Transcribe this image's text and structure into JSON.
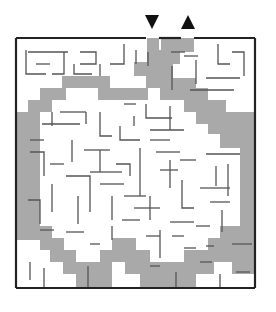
{
  "puzzle": {
    "type": "maze",
    "entrance_marker": "down-triangle",
    "exit_marker": "up-triangle",
    "colors": {
      "background": "#ffffff",
      "wall": "#555555",
      "border": "#222222",
      "solution_path": "#a9a9a9",
      "marker": "#111111"
    },
    "border": {
      "x": 16,
      "y": 38,
      "w": 239,
      "h": 250
    },
    "entrance": {
      "x": 146,
      "w": 13
    },
    "exit": {
      "x": 181,
      "w": 13
    },
    "solution_polygon": "147,38 159,38 159,50 161,50 161,38 194,38 194,52 180,52 180,64 173,64 173,78 196,78 196,88 208,88 208,100 226,100 226,112 254,112 254,274 232,274 232,262 214,262 214,274 196,274 196,287 140,287 140,274 125,274 125,262 112,262 112,287 76,287 76,274 63,274 63,262 50,262 50,250 40,250 40,240 17,240 17,112 28,112 28,100 40,100 40,88 62,88 62,76 110,76 110,88 146,88 146,76 134,76 134,62 147,62",
    "solution_inner_polygon": "40,112 40,226 52,226 52,238 64,238 64,250 76,250 76,262 100,262 100,250 112,250 112,238 136,238 136,250 150,250 150,262 184,262 184,250 196,250 196,250 208,250 208,238 220,238 220,226 240,226 240,148 220,148 220,134 208,134 208,124 196,124 196,112 184,112 184,100 160,100 160,88 148,88 148,100 110,100 110,100 98,100 98,88 66,88 66,100 52,100 52,112",
    "walls": [
      "M26 50 L26 74 L46 74",
      "M28 52 L68 52",
      "M36 64 L50 64",
      "M64 52 L64 74 L52 74",
      "M80 52 L96 52 L96 64 L80 64",
      "M74 64 L74 74 L92 74",
      "M100 64 L100 76",
      "M124 44 L124 64 L110 64",
      "M136 50 L136 64",
      "M148 52 L148 66",
      "M171 52 L185 52",
      "M184 56 L198 56",
      "M196 60 L196 84",
      "M218 44 L218 64 L230 64",
      "M232 52 L244 52 L244 76",
      "M206 78 L240 78",
      "M190 90 L234 90",
      "M172 66 L172 90",
      "M30 140 L44 140",
      "M42 124 L80 124",
      "M52 112 L52 126",
      "M60 112 L86 112",
      "M86 112 L86 124",
      "M100 112 L100 136 L112 136",
      "M120 126 L120 140 L140 140",
      "M146 104 L146 118 L172 118",
      "M124 104 L136 104",
      "M134 116 L134 126",
      "M150 130 L184 130",
      "M170 106 L170 130",
      "M30 152 L44 152 L44 176",
      "M50 164 L64 164",
      "M72 140 L72 162",
      "M84 150 L110 150",
      "M100 150 L100 172",
      "M90 172 L122 172",
      "M116 164 L130 164 L130 176",
      "M140 148 L140 196",
      "M150 140 L170 140",
      "M156 152 L180 152",
      "M170 160 L170 188",
      "M180 160 L196 160",
      "M28 200 L40 200 L40 224",
      "M52 184 L52 212",
      "M66 176 L90 176 L90 212",
      "M78 196 L78 224",
      "M100 184 L124 184",
      "M112 196 L112 220",
      "M124 196 L146 196",
      "M134 208 L160 208",
      "M150 196 L150 220",
      "M160 170 L178 170",
      "M182 180 L182 208 L194 208",
      "M170 222 L194 222",
      "M206 154 L240 154",
      "M216 166 L216 186",
      "M228 164 L228 196",
      "M200 188 L230 188",
      "M210 202 L230 202",
      "M222 210 L222 232",
      "M40 230 L54 230",
      "M66 232 L84 232",
      "M90 244 L100 244",
      "M112 226 L112 240",
      "M122 220 L140 220",
      "M146 236 L160 236",
      "M160 230 L160 258",
      "M172 236 L184 236",
      "M184 248 L196 248",
      "M196 226 L210 226",
      "M206 246 L214 246",
      "M232 244 L252 244",
      "M30 262 L30 280",
      "M44 268 L44 287",
      "M88 266 L88 287",
      "M150 266 L160 266",
      "M176 272 L176 287",
      "M200 262 L212 262",
      "M220 274 L220 287",
      "M236 272 L250 272"
    ]
  }
}
